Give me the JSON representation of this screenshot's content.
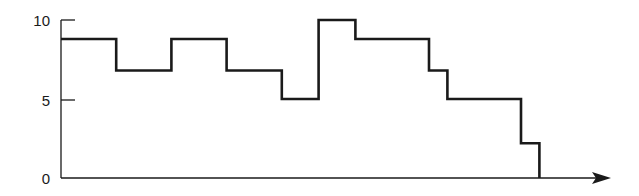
{
  "chart_data": {
    "type": "line",
    "subtype": "step",
    "title": "",
    "xlabel": "",
    "ylabel": "",
    "ylim": [
      0,
      10
    ],
    "yticks": [
      0,
      5,
      10
    ],
    "ytick_labels": [
      "0",
      "5",
      "10"
    ],
    "xticks": [],
    "grid": false,
    "legend": null,
    "x_axis_arrow": true,
    "x_breakpoints": [
      0,
      3,
      6,
      9,
      12,
      14,
      16,
      20,
      21,
      25,
      26
    ],
    "values": [
      8.8,
      6.8,
      8.8,
      6.8,
      5.0,
      10.0,
      8.8,
      6.8,
      5.0,
      2.2
    ],
    "line_color": "#1a1a1a"
  },
  "axes": {
    "y_tick_labels": [
      "10",
      "5",
      "0"
    ]
  }
}
